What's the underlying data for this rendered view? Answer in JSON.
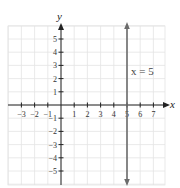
{
  "chart_data": {
    "type": "line",
    "title": "",
    "xlabel": "x",
    "ylabel": "y",
    "xlim": [
      -4,
      7.5
    ],
    "ylim": [
      -6,
      6
    ],
    "grid": true,
    "x_ticks": [
      "-3",
      "-2",
      "-1",
      "1",
      "2",
      "3",
      "4",
      "5",
      "6",
      "7"
    ],
    "y_ticks": [
      "5",
      "4",
      "3",
      "2",
      "1",
      "-1",
      "-2",
      "-3",
      "-4",
      "-5"
    ],
    "series": [
      {
        "name": "x = 5",
        "type": "vertical_line",
        "x": 5,
        "y_range": [
          -6,
          6
        ]
      }
    ],
    "annotations": [
      {
        "text": "x = 5",
        "x": 5.3,
        "y": 2.5
      }
    ]
  },
  "labels": {
    "x_axis": "x",
    "y_axis": "y",
    "line_label": "x = 5"
  },
  "colors": {
    "grid": "#e4e4e4",
    "axis": "#222222",
    "line": "#6b6b6b"
  }
}
